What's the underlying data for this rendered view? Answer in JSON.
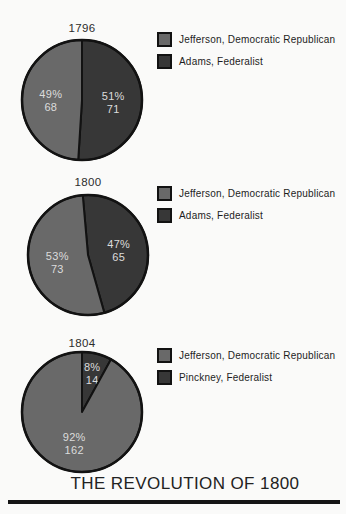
{
  "page": {
    "title": "THE REVOLUTION OF 1800",
    "background": "#fafaf9"
  },
  "colors": {
    "democratic_republican": "#696969",
    "federalist": "#373737",
    "pie_outline": "#121212",
    "slice_label": "#dcdcdc",
    "text": "#242424"
  },
  "chart_data": [
    {
      "type": "pie",
      "year": "1796",
      "rotation_deg": 0,
      "slices": [
        {
          "name": "Adams, Federalist",
          "percent": 51,
          "percent_label": "51%",
          "votes": 71,
          "color": "federalist"
        },
        {
          "name": "Jefferson, Democratic Republican",
          "percent": 49,
          "percent_label": "49%",
          "votes": 68,
          "color": "democratic_republican"
        }
      ],
      "legend": [
        {
          "label": "Jefferson, Democratic Republican",
          "color": "democratic_republican"
        },
        {
          "label": "Adams, Federalist",
          "color": "federalist"
        }
      ]
    },
    {
      "type": "pie",
      "year": "1800",
      "rotation_deg": -5,
      "slices": [
        {
          "name": "Adams, Federalist",
          "percent": 47,
          "percent_label": "47%",
          "votes": 65,
          "color": "federalist"
        },
        {
          "name": "Jefferson, Democratic Republican",
          "percent": 53,
          "percent_label": "53%",
          "votes": 73,
          "color": "democratic_republican"
        }
      ],
      "legend": [
        {
          "label": "Jefferson, Democratic Republican",
          "color": "democratic_republican"
        },
        {
          "label": "Adams, Federalist",
          "color": "federalist"
        }
      ]
    },
    {
      "type": "pie",
      "year": "1804",
      "rotation_deg": 0,
      "slices": [
        {
          "name": "Pinckney, Federalist",
          "percent": 8,
          "percent_label": "8%",
          "votes": 14,
          "color": "federalist"
        },
        {
          "name": "Jefferson, Democratic Republican",
          "percent": 92,
          "percent_label": "92%",
          "votes": 162,
          "color": "democratic_republican"
        }
      ],
      "legend": [
        {
          "label": "Jefferson, Democratic Republican",
          "color": "democratic_republican"
        },
        {
          "label": "Pinckney, Federalist",
          "color": "federalist"
        }
      ]
    }
  ]
}
